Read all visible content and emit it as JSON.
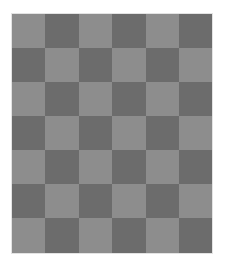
{
  "board": {
    "rows": 7,
    "cols": 6,
    "colors": {
      "light": "#8d8d8d",
      "dark": "#6c6c6c",
      "background": "#ffffff"
    },
    "pattern": [
      [
        "light",
        "dark",
        "light",
        "dark",
        "light",
        "dark"
      ],
      [
        "dark",
        "light",
        "dark",
        "light",
        "dark",
        "light"
      ],
      [
        "light",
        "dark",
        "light",
        "dark",
        "light",
        "dark"
      ],
      [
        "dark",
        "light",
        "dark",
        "light",
        "dark",
        "light"
      ],
      [
        "light",
        "dark",
        "light",
        "dark",
        "light",
        "dark"
      ],
      [
        "dark",
        "light",
        "dark",
        "light",
        "dark",
        "light"
      ],
      [
        "light",
        "dark",
        "light",
        "dark",
        "light",
        "dark"
      ]
    ]
  }
}
